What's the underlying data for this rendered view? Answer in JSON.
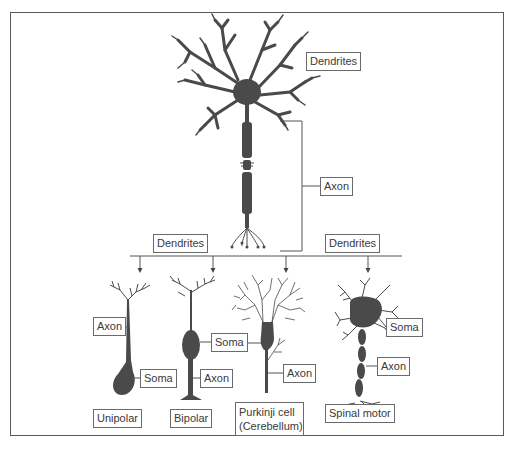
{
  "figure": {
    "title": "",
    "colors": {
      "neuron_fill": "#4a4a4a",
      "line": "#555555",
      "label_border": "#6a6a6a",
      "text": "#3a3a3a",
      "background": "#ffffff"
    }
  },
  "main_neuron": {
    "labels": {
      "dendrites": "Dendrites",
      "axon": "Axon"
    }
  },
  "distribution": {
    "left_label": "Dendrites",
    "right_label": "Dendrites"
  },
  "neuron_types": [
    {
      "name": "Unipolar",
      "labels": {
        "axon": "Axon",
        "soma": "Soma"
      }
    },
    {
      "name": "Bipolar",
      "labels": {
        "soma": "Soma",
        "axon": "Axon"
      }
    },
    {
      "name_line1": "Purkinji cell",
      "name_line2": "(Cerebellum)",
      "labels": {
        "axon": "Axon"
      }
    },
    {
      "name": "Spinal motor",
      "labels": {
        "soma": "Soma",
        "axon": "Axon"
      }
    }
  ]
}
